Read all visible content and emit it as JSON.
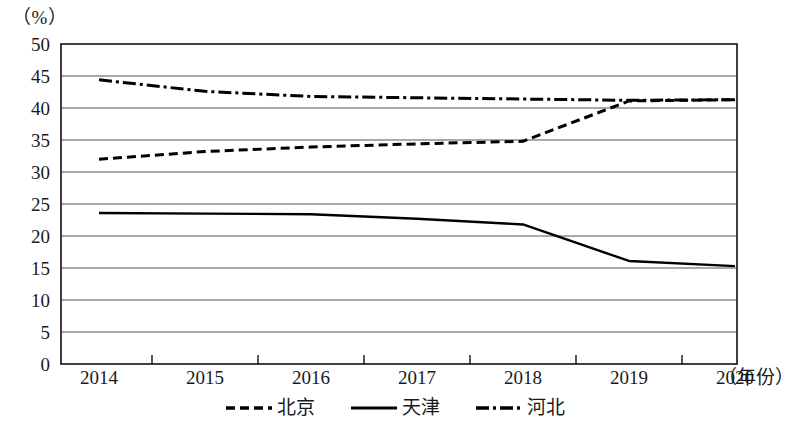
{
  "chart_data": {
    "type": "line",
    "title": "",
    "subtitle": "",
    "xlabel": "（年份）",
    "ylabel": "（%）",
    "unit_label": "（%）",
    "x_axis_name": "（年份）",
    "categories": [
      "2014",
      "2015",
      "2016",
      "2017",
      "2018",
      "2019",
      "2020"
    ],
    "x": [
      2014,
      2015,
      2016,
      2017,
      2018,
      2019,
      2020
    ],
    "xlim": [
      2014,
      2020
    ],
    "ylim": [
      0,
      50
    ],
    "y_ticks": [
      0,
      5,
      10,
      15,
      20,
      25,
      30,
      35,
      40,
      45,
      50
    ],
    "y_tick_labels": [
      "0",
      "5",
      "10",
      "15",
      "20",
      "25",
      "30",
      "35",
      "40",
      "45",
      "50"
    ],
    "grid": true,
    "grid_axis": "y",
    "legend_position": "bottom",
    "series": [
      {
        "name": "北京",
        "style": "dotted",
        "color": "#000000",
        "values": [
          32.0,
          33.2,
          33.9,
          34.4,
          34.8,
          41.1,
          41.3
        ]
      },
      {
        "name": "天津",
        "style": "solid",
        "color": "#000000",
        "values": [
          23.6,
          23.5,
          23.4,
          22.7,
          21.8,
          16.1,
          15.3
        ]
      },
      {
        "name": "河北",
        "style": "dashdot",
        "color": "#000000",
        "values": [
          44.4,
          42.6,
          41.8,
          41.6,
          41.4,
          41.2,
          41.3
        ]
      }
    ]
  },
  "legend": {
    "items": [
      {
        "label": "北京",
        "style": "dotted"
      },
      {
        "label": "天津",
        "style": "solid"
      },
      {
        "label": "河北",
        "style": "dashdot"
      }
    ]
  }
}
